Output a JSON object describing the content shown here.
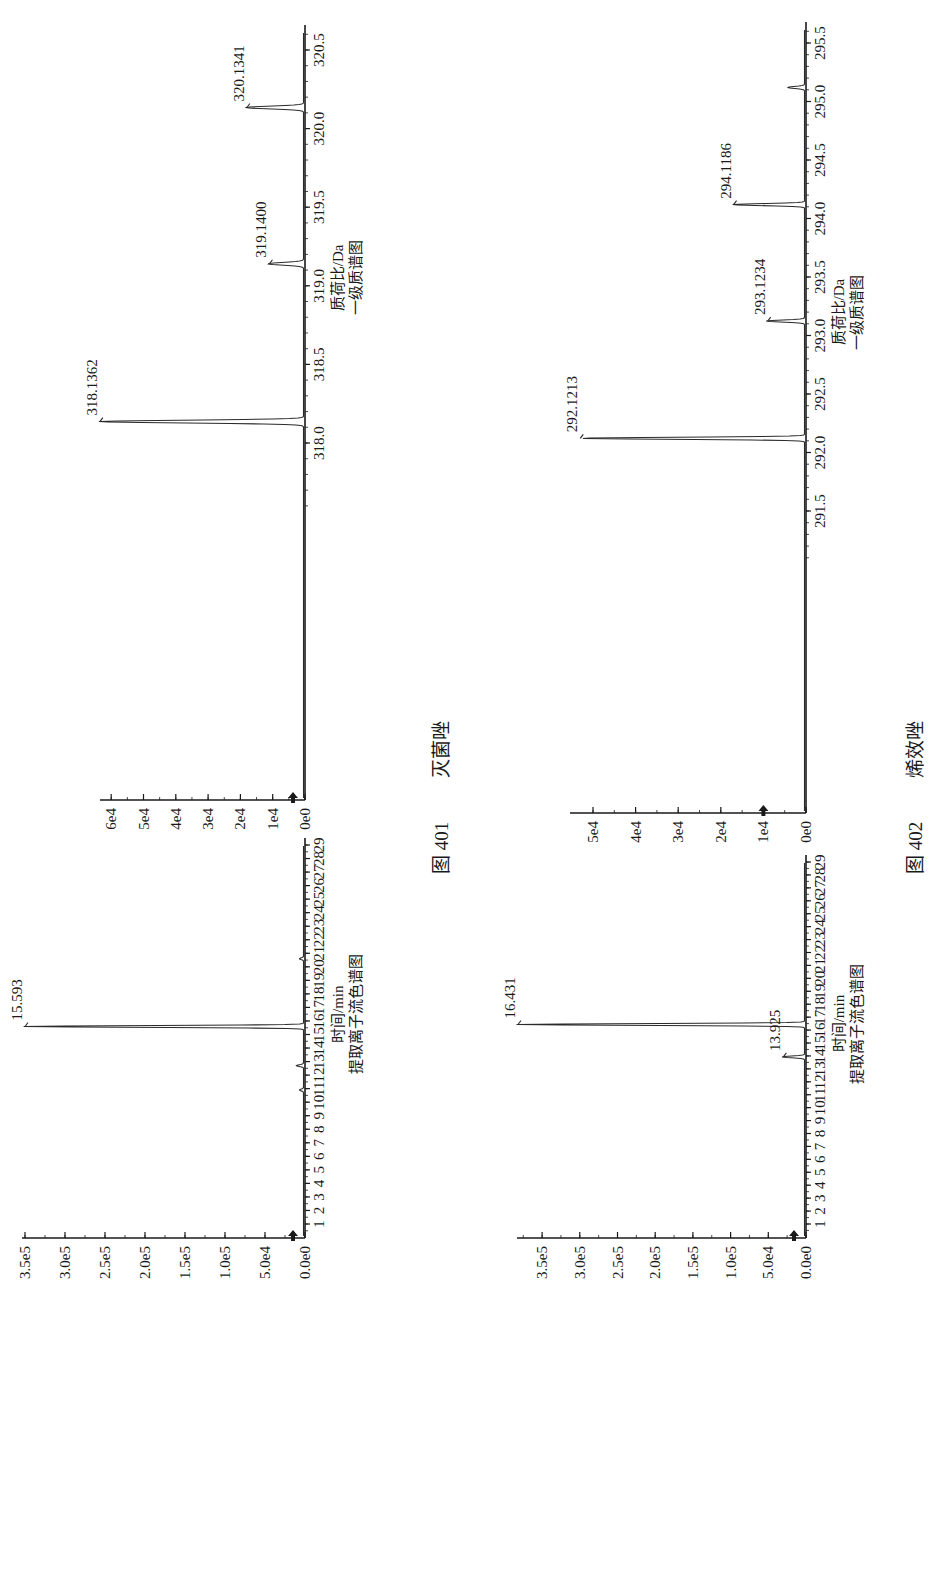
{
  "page": {
    "orientation": "rotated 90° counter-clockwise",
    "figures": [
      {
        "number": "图 401",
        "compound": "灭菌唑"
      },
      {
        "number": "图 402",
        "compound": "烯效唑"
      }
    ]
  },
  "chart_data": [
    {
      "id": "fig401-eic",
      "type": "line",
      "figure": "图 401",
      "compound": "灭菌唑",
      "title": "提取离子流色谱图",
      "xlabel": "时间/min",
      "ylabel": "",
      "x_ticks": [
        "1",
        "2",
        "3",
        "4",
        "5",
        "6",
        "7",
        "8",
        "9",
        "10",
        "11",
        "12",
        "13",
        "14",
        "15",
        "16",
        "17",
        "18",
        "19",
        "20",
        "21",
        "22",
        "23",
        "24",
        "25",
        "26",
        "27",
        "28",
        "29"
      ],
      "y_ticks": [
        "0.0e0",
        "5.0e4",
        "1.0e5",
        "1.5e5",
        "2.0e5",
        "2.5e5",
        "3.0e5",
        "3.5e5"
      ],
      "xlim": [
        0.5,
        29.5
      ],
      "ylim": [
        0,
        350000
      ],
      "peaks": [
        {
          "x": 15.593,
          "y": 350000,
          "label": "15.593"
        },
        {
          "x": 12.7,
          "y": 9000,
          "label": ""
        },
        {
          "x": 10.9,
          "y": 5000,
          "label": ""
        },
        {
          "x": 20.6,
          "y": 5000,
          "label": ""
        }
      ],
      "grid": false
    },
    {
      "id": "fig401-ms",
      "type": "bar",
      "figure": "图 401",
      "compound": "灭菌唑",
      "title": "一级质谱图",
      "xlabel": "质荷比/Da",
      "ylabel": "",
      "x_ticks": [
        "318.0",
        "318.5",
        "319.0",
        "319.5",
        "320.0",
        "320.5"
      ],
      "y_ticks": [
        "0e0",
        "1e4",
        "2e4",
        "3e4",
        "4e4",
        "5e4",
        "6e4"
      ],
      "xlim": [
        317.6,
        320.6
      ],
      "ylim": [
        0,
        65000
      ],
      "peaks": [
        {
          "x": 318.1362,
          "y": 63500,
          "label": "318.1362"
        },
        {
          "x": 319.14,
          "y": 11000,
          "label": "319.1400"
        },
        {
          "x": 320.1341,
          "y": 18000,
          "label": "320.1341"
        }
      ],
      "grid": false
    },
    {
      "id": "fig402-eic",
      "type": "line",
      "figure": "图 402",
      "compound": "烯效唑",
      "title": "提取离子流色谱图",
      "xlabel": "时间/min",
      "ylabel": "",
      "x_ticks": [
        "1",
        "2",
        "3",
        "4",
        "5",
        "6",
        "7",
        "8",
        "9",
        "10",
        "11",
        "12",
        "13",
        "14",
        "15",
        "16",
        "17",
        "18",
        "19",
        "20",
        "21",
        "22",
        "23",
        "24",
        "25",
        "26",
        "27",
        "28",
        "29"
      ],
      "y_ticks": [
        "0.0e0",
        "5.0e4",
        "1.0e5",
        "1.5e5",
        "2.0e5",
        "2.5e5",
        "3.0e5",
        "3.5e5"
      ],
      "xlim": [
        0.5,
        29.5
      ],
      "ylim": [
        0,
        380000
      ],
      "peaks": [
        {
          "x": 16.431,
          "y": 382000,
          "label": "16.431"
        },
        {
          "x": 13.925,
          "y": 30000,
          "label": "13.925"
        }
      ],
      "grid": false
    },
    {
      "id": "fig402-ms",
      "type": "bar",
      "figure": "图 402",
      "compound": "烯效唑",
      "title": "一级质谱图",
      "xlabel": "质荷比/Da",
      "ylabel": "",
      "x_ticks": [
        "291.5",
        "292.0",
        "292.5",
        "293.0",
        "293.5",
        "294.0",
        "294.5",
        "295.0",
        "295.5"
      ],
      "y_ticks": [
        "0e0",
        "1e4",
        "2e4",
        "3e4",
        "4e4",
        "5e4"
      ],
      "xlim": [
        291.25,
        295.65
      ],
      "ylim": [
        0,
        54000
      ],
      "peaks": [
        {
          "x": 292.1213,
          "y": 53000,
          "label": "292.1213"
        },
        {
          "x": 293.1234,
          "y": 9000,
          "label": "293.1234"
        },
        {
          "x": 294.1186,
          "y": 17000,
          "label": "294.1186"
        },
        {
          "x": 295.12,
          "y": 4000,
          "label": ""
        }
      ],
      "grid": false
    }
  ]
}
